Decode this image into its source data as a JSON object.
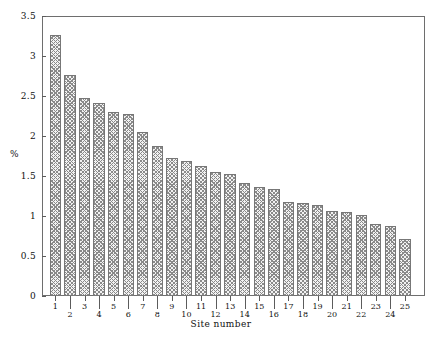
{
  "chart_data": {
    "type": "bar",
    "title": "",
    "subtitle": "",
    "xlabel": "Site number",
    "ylabel": "%",
    "categories": [
      "1",
      "2",
      "3",
      "4",
      "5",
      "6",
      "7",
      "8",
      "9",
      "10",
      "11",
      "12",
      "13",
      "14",
      "15",
      "16",
      "17",
      "18",
      "19",
      "20",
      "21",
      "22",
      "23",
      "24",
      "25"
    ],
    "values": [
      3.26,
      2.76,
      2.47,
      2.41,
      2.3,
      2.27,
      2.05,
      1.88,
      1.73,
      1.69,
      1.62,
      1.55,
      1.53,
      1.41,
      1.36,
      1.34,
      1.18,
      1.16,
      1.14,
      1.06,
      1.05,
      1.01,
      0.9,
      0.88,
      0.71
    ],
    "ylim": [
      0,
      3.5
    ],
    "ytick_values": [
      0,
      0.5,
      1,
      1.5,
      2,
      2.5,
      3,
      3.5
    ],
    "ytick_labels": [
      "0",
      "0.5",
      "1",
      "1.5",
      "2",
      "2.5",
      "3",
      "3.5"
    ],
    "xtick_labels": [
      "1",
      "2",
      "3",
      "4",
      "5",
      "6",
      "7",
      "8",
      "9",
      "10",
      "11",
      "12",
      "13",
      "14",
      "15",
      "16",
      "17",
      "18",
      "19",
      "20",
      "21",
      "22",
      "23",
      "24",
      "25"
    ],
    "grid": false,
    "legend": null,
    "legend_position": "none",
    "bar_fill": "#f2f2f2",
    "bar_hatch_color": "#8a8a8a",
    "bar_edge_color": "#777777",
    "axis_color": "#6e6e6e",
    "background": "#ffffff",
    "annotations": []
  }
}
